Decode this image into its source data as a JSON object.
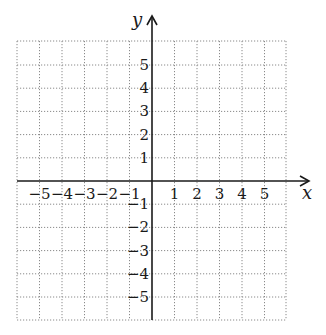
{
  "figure": {
    "x_axis_label": "x",
    "y_axis_label": "y"
  },
  "chart_data": {
    "type": "coordinate-grid",
    "xlabel": "x",
    "ylabel": "y",
    "xlim": [
      -6,
      6
    ],
    "ylim": [
      -6,
      6
    ],
    "grid": true,
    "grid_style": "dotted",
    "x_tick_labels": [
      "-5",
      "-4",
      "-3",
      "-2",
      "-1",
      "1",
      "2",
      "3",
      "4",
      "5"
    ],
    "y_tick_labels": [
      "5",
      "4",
      "3",
      "2",
      "1",
      "-1",
      "-2",
      "-3",
      "-4",
      "-5"
    ],
    "x_ticks": [
      -5,
      -4,
      -3,
      -2,
      -1,
      1,
      2,
      3,
      4,
      5
    ],
    "y_ticks": [
      5,
      4,
      3,
      2,
      1,
      -1,
      -2,
      -3,
      -4,
      -5
    ],
    "data_points": []
  },
  "layout": {
    "origin_px": [
      152,
      181
    ],
    "unit_x_px": 22.5,
    "unit_y_px": 23.2,
    "grid_left": 17,
    "grid_right": 286,
    "grid_top": 41,
    "grid_bottom": 320,
    "x_axis_end": 309,
    "y_axis_top": 16
  }
}
